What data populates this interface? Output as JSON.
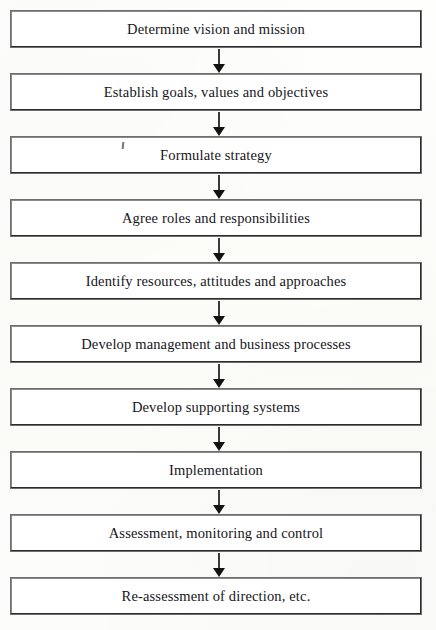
{
  "diagram": {
    "type": "vertical-flowchart",
    "orientation": "top-to-bottom",
    "step_count": 10,
    "connector_count": 9,
    "connector_glyph": "down-arrow",
    "colors": {
      "page_background": "#fdfdfb",
      "box_fill": "#ffffff",
      "box_border": "#2b2b2b",
      "text": "#16161a",
      "arrow": "#121212"
    },
    "steps": [
      {
        "index": 1,
        "label": "Determine vision and mission"
      },
      {
        "index": 2,
        "label": "Establish goals, values and objectives"
      },
      {
        "index": 3,
        "label": "Formulate strategy"
      },
      {
        "index": 4,
        "label": "Agree roles and responsibilities"
      },
      {
        "index": 5,
        "label": "Identify resources, attitudes and approaches"
      },
      {
        "index": 6,
        "label": "Develop management and business processes"
      },
      {
        "index": 7,
        "label": "Develop supporting systems"
      },
      {
        "index": 8,
        "label": "Implementation"
      },
      {
        "index": 9,
        "label": "Assessment, monitoring and control"
      },
      {
        "index": 10,
        "label": "Re-assessment of direction, etc."
      }
    ]
  }
}
